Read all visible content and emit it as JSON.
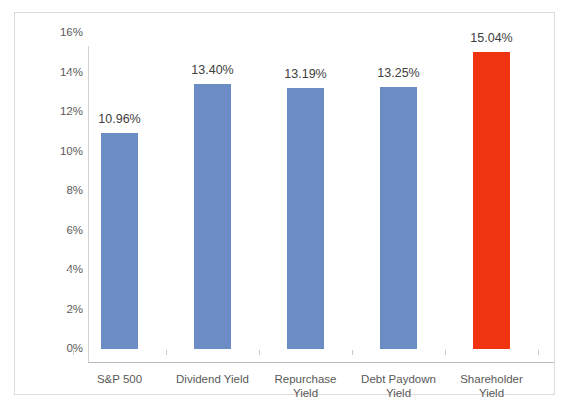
{
  "chart_data": {
    "type": "bar",
    "title": "",
    "subtitle": "",
    "xlabel": "",
    "ylabel": "",
    "categories": [
      "S&P 500",
      "Dividend Yield",
      "Repurchase Yield",
      "Debt Paydown Yield",
      "Shareholder Yield"
    ],
    "category_lines": [
      [
        "S&P 500"
      ],
      [
        "Dividend Yield"
      ],
      [
        "Repurchase",
        "Yield"
      ],
      [
        "Debt Paydown",
        "Yield"
      ],
      [
        "Shareholder",
        "Yield"
      ]
    ],
    "values": [
      10.96,
      13.4,
      13.19,
      13.25,
      15.04
    ],
    "data_labels": [
      "10.96%",
      "13.40%",
      "13.19%",
      "13.25%",
      "15.04%"
    ],
    "bar_colors": [
      "#6B8CC4",
      "#6B8CC4",
      "#6B8CC4",
      "#6B8CC4",
      "#F03311"
    ],
    "ylim": [
      0,
      16
    ],
    "ytick_values": [
      0,
      2,
      4,
      6,
      8,
      10,
      12,
      14,
      16
    ],
    "ytick_labels": [
      "0%",
      "2%",
      "4%",
      "6%",
      "8%",
      "10%",
      "12%",
      "14%",
      "16%"
    ],
    "grid": false,
    "legend": false,
    "legend_position": "none",
    "accent_color": "#F03311",
    "series_color": "#6B8CC4",
    "axis_color": "#bdbdbd",
    "border_color": "#dcdcdc",
    "background_color": "#ffffff"
  }
}
